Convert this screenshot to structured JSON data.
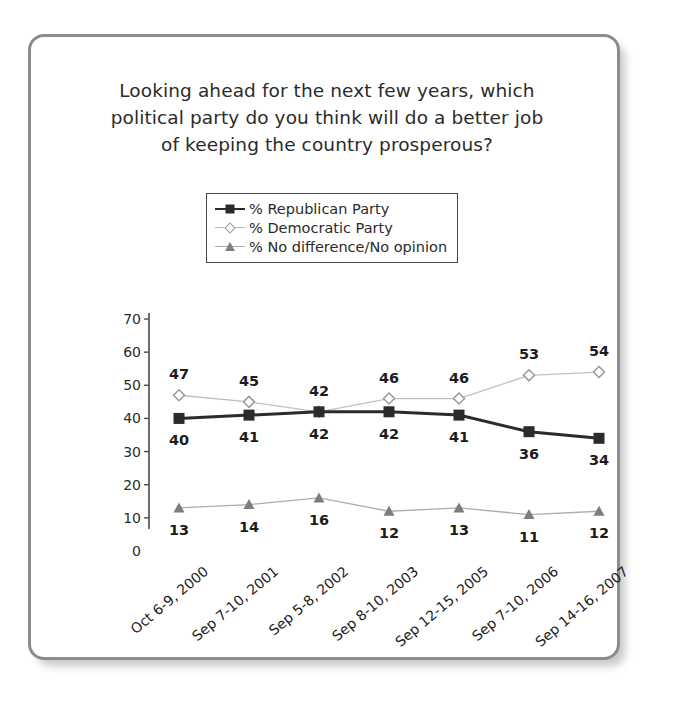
{
  "chart_data": {
    "type": "line",
    "title": "Looking ahead for the next few years, which political party do you think will do a better job of keeping the country prosperous?",
    "title_lines": [
      "Looking ahead for the next few years, which",
      "political party do you think will do a better job",
      "of keeping the country prosperous?"
    ],
    "xlabel": "",
    "ylabel": "",
    "ylim": [
      0,
      70
    ],
    "yticks": [
      0,
      10,
      20,
      30,
      40,
      50,
      60,
      70
    ],
    "grid": false,
    "legend_position": "top-center",
    "categories": [
      "Oct 6-9, 2000",
      "Sep 7-10, 2001",
      "Sep 5-8, 2002",
      "Sep 8-10, 2003",
      "Sep 12-15, 2005",
      "Sep 7-10, 2006",
      "Sep 14-16, 2007"
    ],
    "series": [
      {
        "name": "% Republican Party",
        "marker": "square",
        "color": "#2b2b2b",
        "values": [
          40,
          41,
          42,
          42,
          41,
          36,
          34
        ],
        "label_position": "below"
      },
      {
        "name": "% Democratic Party",
        "marker": "diamond",
        "color": "#9a9a9a",
        "values": [
          47,
          45,
          42,
          46,
          46,
          53,
          54
        ],
        "label_position": "above"
      },
      {
        "name": "% No difference/No opinion",
        "marker": "triangle",
        "color": "#7d7d7d",
        "values": [
          13,
          14,
          16,
          12,
          13,
          11,
          12
        ],
        "label_position": "below"
      }
    ]
  },
  "legend": {
    "items": [
      {
        "label": "% Republican Party",
        "marker": "square"
      },
      {
        "label": "% Democratic Party",
        "marker": "diamond"
      },
      {
        "label": "% No difference/No opinion",
        "marker": "triangle"
      }
    ]
  },
  "colors": {
    "republican": "#2b2b2b",
    "democratic": "#9a9a9a",
    "nodifference": "#7d7d7d",
    "card_border": "#8c8c8c",
    "axis": "#4a4a4a",
    "text": "#2b2b2b"
  }
}
